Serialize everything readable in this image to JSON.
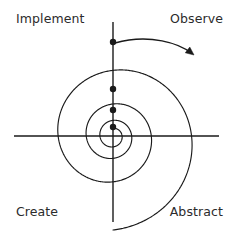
{
  "figure": {
    "width": 233,
    "height": 232,
    "background": "#ffffff",
    "stroke_color": "#1a1a1a",
    "text_color": "#2b2b2b"
  },
  "labels": {
    "top_left": "Implement",
    "top_right": "Observe",
    "bottom_left": "Create",
    "bottom_right": "Abstract"
  },
  "chart_data": {
    "type": "line",
    "title": "",
    "xlabel": "",
    "ylabel": "",
    "grid": false,
    "legend": "none",
    "axes": {
      "center": [
        113,
        136
      ],
      "horizontal": {
        "x1": 14,
        "y1": 136,
        "x2": 219,
        "y2": 136
      },
      "vertical": {
        "x1": 113,
        "y1": 22,
        "x2": 113,
        "y2": 222
      }
    },
    "spiral": {
      "kind": "logarithmic",
      "center": [
        113,
        136
      ],
      "direction": "clockwise-outward",
      "turns": 3.5,
      "growth_factor": 2.05,
      "inner_radius": 3,
      "outer_radius": 94,
      "start_angle_deg": -90
    },
    "markers": {
      "label": "spiral crossings on upper vertical axis",
      "radius_px": 3.2,
      "points": [
        {
          "x": 113,
          "y": 42
        },
        {
          "x": 113,
          "y": 89
        },
        {
          "x": 113,
          "y": 110
        },
        {
          "x": 113,
          "y": 127
        }
      ]
    },
    "arrow": {
      "label": "clockwise direction arrow",
      "path": [
        [
          115,
          43
        ],
        [
          150,
          33
        ],
        [
          180,
          44
        ],
        [
          191,
          53
        ]
      ],
      "head_tip": [
        194,
        55
      ],
      "head_size": 9
    }
  }
}
